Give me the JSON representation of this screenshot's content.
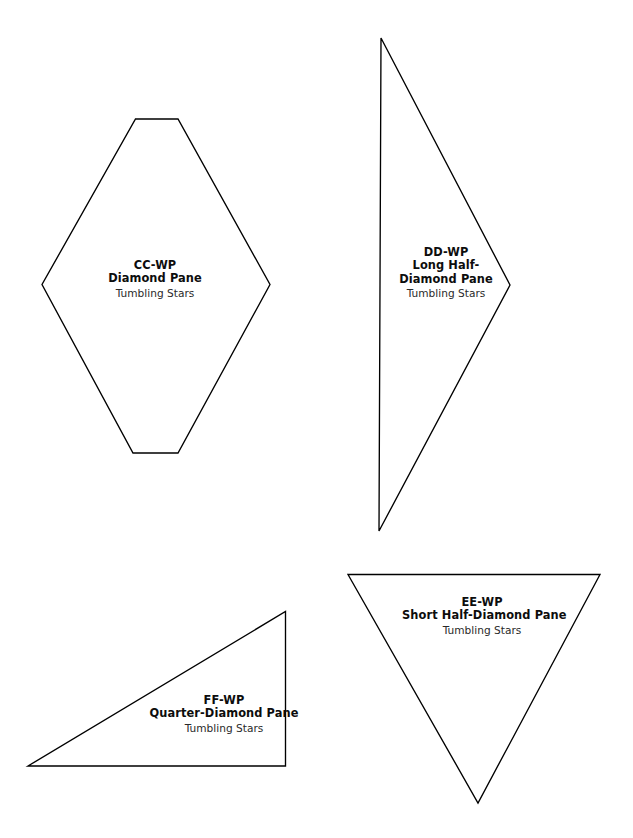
{
  "page": {
    "background_color": "#ffffff",
    "stroke_color": "#000000",
    "width": 633,
    "height": 838
  },
  "templates": [
    {
      "id": "cc-wp",
      "code": "CC-WP",
      "name": "Diamond Pane",
      "collection": "Tumbling Stars",
      "shape": "elongated-hexagon-diamond",
      "points": "135.5,119 178,119 270,284.5 178,453 133,453 42,284.5"
    },
    {
      "id": "dd-wp",
      "code": "DD-WP",
      "name_line1": "Long Half-",
      "name_line2": "Diamond Pane",
      "collection": "Tumbling Stars",
      "shape": "long-half-diamond-triangle",
      "points": "381,38 510,285 379,531"
    },
    {
      "id": "ff-wp",
      "code": "FF-WP",
      "name": "Quarter-Diamond Pane",
      "collection": "Tumbling Stars",
      "shape": "quarter-diamond-right-triangle",
      "points": "28,766 285.5,766 285.5,611.5"
    },
    {
      "id": "ee-wp",
      "code": "EE-WP",
      "name": "Short Half-Diamond Pane",
      "collection": "Tumbling Stars",
      "shape": "short-half-diamond-inverted-triangle",
      "points": "348,574.5 600,574.5 478,803"
    }
  ]
}
